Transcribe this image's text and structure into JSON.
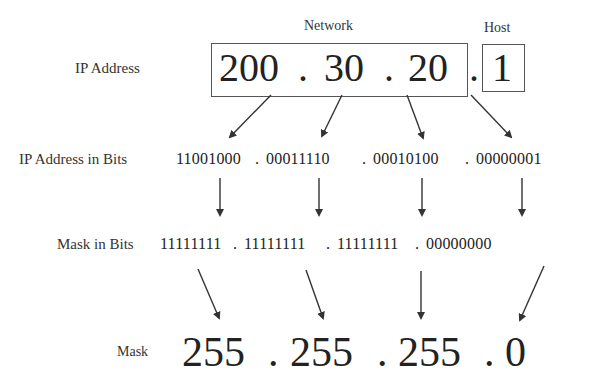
{
  "diagram": {
    "headers": {
      "network": "Network",
      "host": "Host"
    },
    "rows": {
      "ip_address": {
        "label": "IP Address",
        "octets": [
          "200",
          "30",
          "20",
          "1"
        ],
        "separator": "."
      },
      "ip_bits": {
        "label": "IP Address in Bits",
        "octets": [
          "11001000",
          "00011110",
          "00010100",
          "00000001"
        ],
        "separator": "."
      },
      "mask_bits": {
        "label": "Mask in Bits",
        "octets": [
          "11111111",
          "11111111",
          "11111111",
          "00000000"
        ],
        "separator": "."
      },
      "mask": {
        "label": "Mask",
        "octets": [
          "255",
          "255",
          "255",
          "0"
        ],
        "separator": "."
      }
    },
    "colors": {
      "text": "#222222",
      "box_border": "#555555",
      "arrow": "#333333"
    }
  }
}
